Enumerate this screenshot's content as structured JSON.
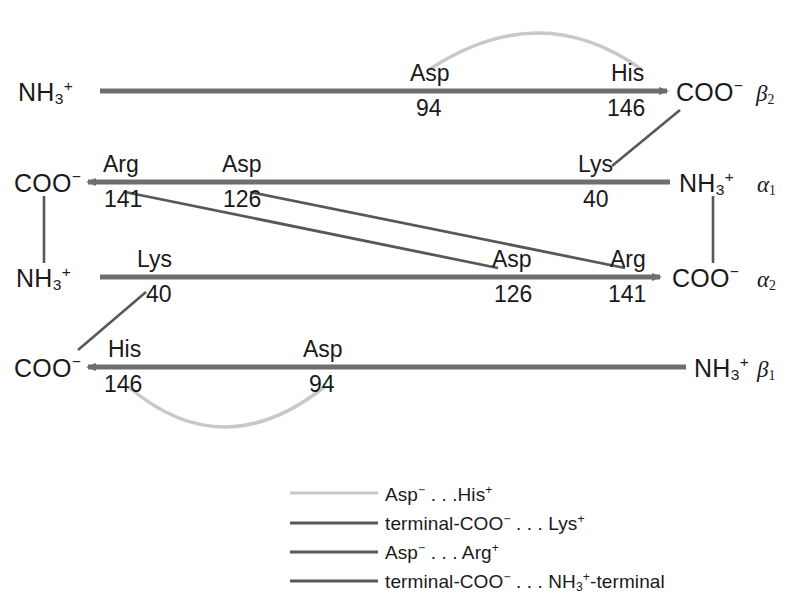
{
  "figure": {
    "colors": {
      "chain_arrow": "#6e6e6e",
      "salt_bridge_dark": "#585858",
      "salt_bridge_light": "#c8c8c8",
      "text": "#1a1a1a"
    }
  },
  "chains": [
    {
      "id": "beta2",
      "label": "β",
      "sub": "2",
      "left_terminal": "NH",
      "left_sub": "3",
      "left_sup": "+",
      "right_terminal": "COO",
      "right_sup": "−",
      "direction": "right",
      "residues": [
        {
          "name": "Asp",
          "number": "94"
        },
        {
          "name": "His",
          "number": "146"
        }
      ]
    },
    {
      "id": "alpha1",
      "label": "α",
      "sub": "1",
      "left_terminal": "COO",
      "left_sup": "−",
      "right_terminal": "NH",
      "right_sub": "3",
      "right_sup": "+",
      "direction": "left",
      "residues": [
        {
          "name": "Arg",
          "number": "141"
        },
        {
          "name": "Asp",
          "number": "126"
        },
        {
          "name": "Lys",
          "number": "40"
        }
      ]
    },
    {
      "id": "alpha2",
      "label": "α",
      "sub": "2",
      "left_terminal": "NH",
      "left_sub": "3",
      "left_sup": "+",
      "right_terminal": "COO",
      "right_sup": "−",
      "direction": "right",
      "residues": [
        {
          "name": "Lys",
          "number": "40"
        },
        {
          "name": "Asp",
          "number": "126"
        },
        {
          "name": "Arg",
          "number": "141"
        }
      ]
    },
    {
      "id": "beta1",
      "label": "β",
      "sub": "1",
      "left_terminal": "COO",
      "left_sup": "−",
      "right_terminal": "NH",
      "right_sub": "3",
      "right_sup": "+",
      "direction": "left",
      "residues": [
        {
          "name": "His",
          "number": "146"
        },
        {
          "name": "Asp",
          "number": "94"
        }
      ]
    }
  ],
  "labels": {
    "b2_left_term": "NH",
    "b2_left_sub": "3",
    "b2_left_sup": "+",
    "b2_asp": "Asp",
    "b2_asp_num": "94",
    "b2_his": "His",
    "b2_his_num": "146",
    "b2_right_term": "COO",
    "b2_right_sup": "−",
    "b2_chain": "β",
    "b2_chain_sub": "2",
    "a1_left_term": "COO",
    "a1_left_sup": "−",
    "a1_arg": "Arg",
    "a1_arg_num": "141",
    "a1_asp": "Asp",
    "a1_asp_num": "126",
    "a1_lys": "Lys",
    "a1_lys_num": "40",
    "a1_right_term": "NH",
    "a1_right_sub": "3",
    "a1_right_sup": "+",
    "a1_chain": "α",
    "a1_chain_sub": "1",
    "a2_left_term": "NH",
    "a2_left_sub": "3",
    "a2_left_sup": "+",
    "a2_lys": "Lys",
    "a2_lys_num": "40",
    "a2_asp": "Asp",
    "a2_asp_num": "126",
    "a2_arg": "Arg",
    "a2_arg_num": "141",
    "a2_right_term": "COO",
    "a2_right_sup": "−",
    "a2_chain": "α",
    "a2_chain_sub": "2",
    "b1_left_term": "COO",
    "b1_left_sup": "−",
    "b1_his": "His",
    "b1_his_num": "146",
    "b1_asp": "Asp",
    "b1_asp_num": "94",
    "b1_right_term": "NH",
    "b1_right_sub": "3",
    "b1_right_sup": "+",
    "b1_chain": "β",
    "b1_chain_sub": "1"
  },
  "legend": {
    "items": [
      {
        "swatch_color": "#c8c8c8",
        "pre": "Asp",
        "pre_sup": "−",
        "dots": " . . .",
        "post": "His",
        "post_sup": "+",
        "full_text": "Asp− . . . His+"
      },
      {
        "swatch_color": "#585858",
        "pre": "terminal-COO",
        "pre_sup": "−",
        "dots": " . . . ",
        "post": "Lys",
        "post_sup": "+",
        "full_text": "terminal-COO− . . . Lys+"
      },
      {
        "swatch_color": "#585858",
        "pre": "Asp",
        "pre_sup": "−",
        "dots": " . . . ",
        "post": "Arg",
        "post_sup": "+",
        "full_text": "Asp− . . . Arg+"
      },
      {
        "swatch_color": "#585858",
        "pre": "terminal-COO",
        "pre_sup": "−",
        "dots": " . . . ",
        "post": "NH",
        "post_sub": "3",
        "post_sup": "+",
        "post_tail": "-terminal",
        "full_text": "terminal-COO− . . . NH3+-terminal"
      }
    ]
  }
}
